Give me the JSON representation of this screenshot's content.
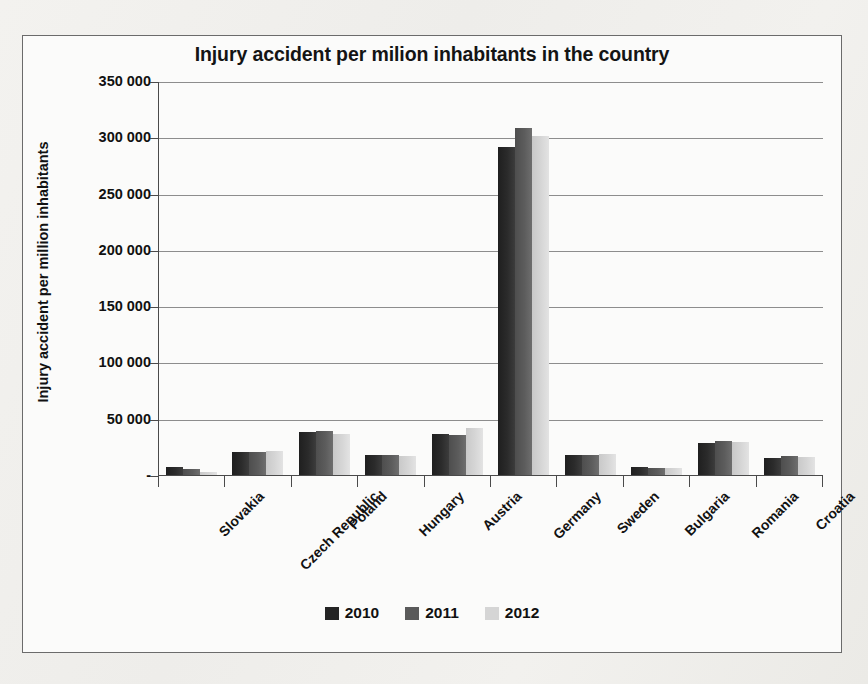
{
  "chart_data": {
    "type": "bar",
    "title": "Injury accident per milion inhabitants in the country",
    "xlabel": "",
    "ylabel": "Injury accident per million inhabitants",
    "ylim": [
      0,
      350000
    ],
    "ytick_values": [
      350000,
      300000,
      250000,
      200000,
      150000,
      100000,
      50000,
      0
    ],
    "ytick_labels": [
      "350 000",
      "300 000",
      "250 000",
      "200 000",
      "150 000",
      "100 000",
      "50 000",
      "-"
    ],
    "grid": true,
    "legend_position": "bottom",
    "categories": [
      "Slovakia",
      "Czech Republic",
      "Poland",
      "Hungary",
      "Austria",
      "Germany",
      "Sweden",
      "Bulgaria",
      "Romania",
      "Croatia"
    ],
    "series": [
      {
        "name": "2010",
        "color": "#242424",
        "values": [
          8000,
          21000,
          39000,
          19000,
          37000,
          292000,
          19000,
          8000,
          29000,
          16000
        ]
      },
      {
        "name": "2011",
        "color": "#5a5a5a",
        "values": [
          6000,
          21000,
          40000,
          19000,
          36000,
          309000,
          19000,
          7000,
          31000,
          18000
        ]
      },
      {
        "name": "2012",
        "color": "#d5d5d5",
        "values": [
          4000,
          22000,
          37000,
          18000,
          43000,
          302000,
          20000,
          7000,
          30000,
          17000
        ]
      }
    ]
  }
}
